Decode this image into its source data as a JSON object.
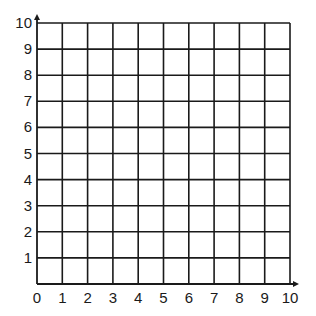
{
  "chart_data": {
    "type": "grid",
    "title": "",
    "xlabel": "",
    "ylabel": "",
    "x_ticks": [
      "0",
      "1",
      "2",
      "3",
      "4",
      "5",
      "6",
      "7",
      "8",
      "9",
      "10"
    ],
    "y_ticks": [
      "1",
      "2",
      "3",
      "4",
      "5",
      "6",
      "7",
      "8",
      "9",
      "10"
    ],
    "xlim": [
      0,
      10
    ],
    "ylim": [
      0,
      10
    ],
    "grid": true,
    "grid_cells": [
      10,
      10
    ],
    "axis_arrows": {
      "x": true,
      "y": true
    },
    "series": []
  },
  "colors": {
    "line": "#1a1a1a",
    "background": "#ffffff"
  },
  "icons": {
    "x_axis_arrow": "arrow-right-icon",
    "y_axis_arrow": "arrow-up-icon"
  }
}
